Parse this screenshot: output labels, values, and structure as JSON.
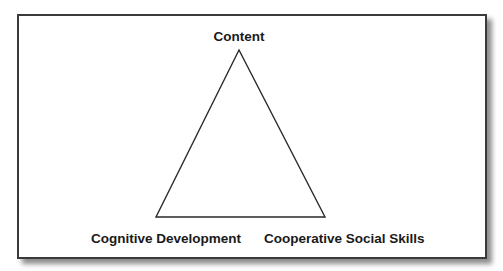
{
  "diagram": {
    "type": "triangle",
    "vertices": {
      "top": {
        "label": "Content"
      },
      "bottom_left": {
        "label": "Cognitive Development"
      },
      "bottom_right": {
        "label": "Cooperative Social Skills"
      }
    },
    "colors": {
      "stroke": "#2a2a2a",
      "frame_border": "#3a3a3a",
      "background": "#ffffff",
      "text": "#1a1a1a"
    }
  }
}
